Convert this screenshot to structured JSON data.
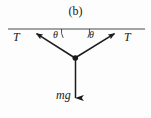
{
  "figure": {
    "caption": "(b)",
    "type": "free-body-diagram",
    "background_color": "#fdfdfd",
    "stroke_color": "#1a1a1a",
    "labels": {
      "tension_left": "T",
      "tension_right": "T",
      "angle_left": "θ",
      "angle_right": "θ",
      "weight": "mg"
    },
    "geometry": {
      "ceiling_y": 29,
      "ceiling_x_start": 8,
      "ceiling_x_end": 145,
      "vertex_x": 75,
      "vertex_y": 58,
      "left_arrow_tip_x": 34,
      "left_arrow_tip_y": 32,
      "right_arrow_tip_x": 117,
      "right_arrow_tip_y": 32,
      "weight_arrow_tip_y": 106
    }
  }
}
